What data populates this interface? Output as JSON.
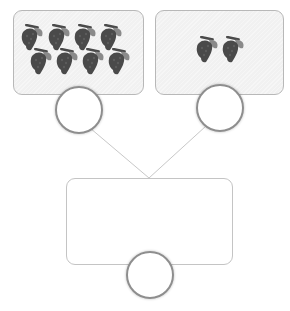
{
  "diagram": {
    "left_part": {
      "item": "grape-bunch",
      "count": 8,
      "answer": ""
    },
    "right_part": {
      "item": "grape-bunch",
      "count": 2,
      "answer": ""
    },
    "whole": {
      "answer": ""
    },
    "colors": {
      "grape": "#4a4a4a",
      "leaf": "#8a8a8a",
      "box_fill": "#f1f1f1",
      "border": "#b8b8b8",
      "circle_border": "#8e8e8e",
      "connector": "#c8c8c8"
    }
  }
}
